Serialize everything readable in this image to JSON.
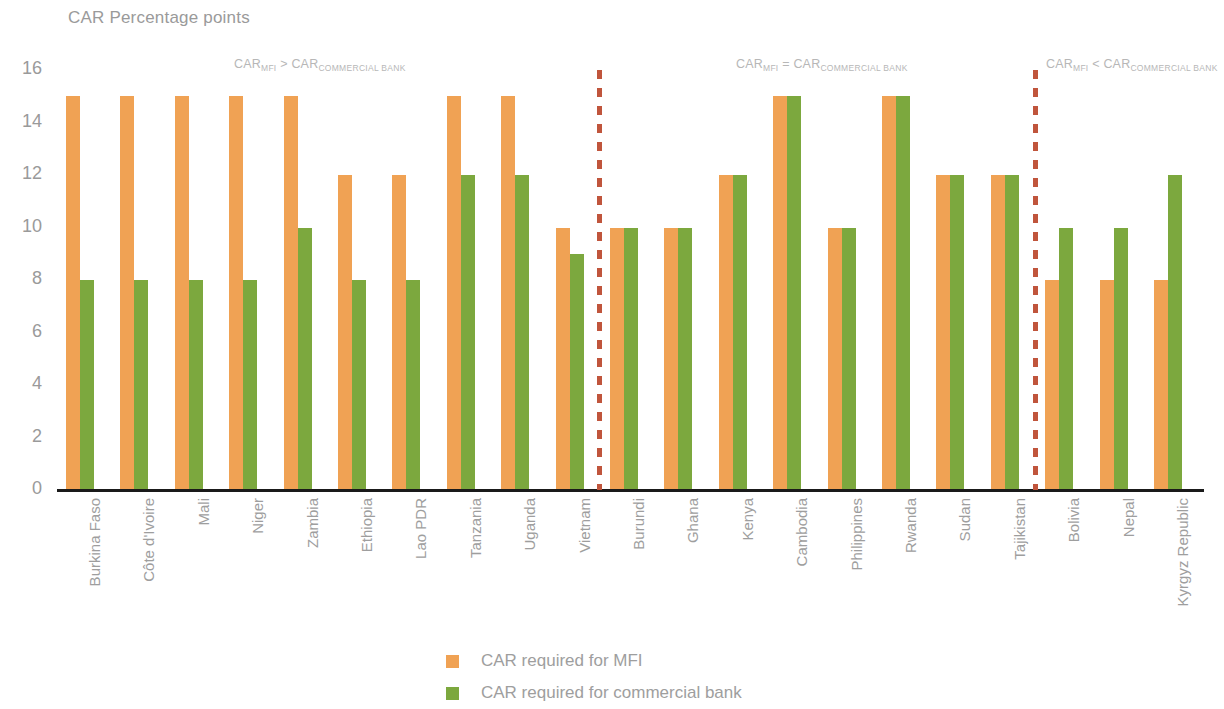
{
  "chart_data": {
    "type": "bar",
    "title": "CAR Percentage points",
    "xlabel": "",
    "ylabel": "",
    "ylim": [
      0,
      16
    ],
    "yticks": [
      16,
      14,
      12,
      10,
      8,
      6,
      4,
      2,
      0
    ],
    "grid": false,
    "legend_position": "bottom",
    "categories": [
      "Burkina Faso",
      "Côte d'Ivoire",
      "Mali",
      "Niger",
      "Zambia",
      "Ethiopia",
      "Lao PDR",
      "Tanzania",
      "Uganda",
      "Vietnam",
      "Burundi",
      "Ghana",
      "Kenya",
      "Cambodia",
      "Philippines",
      "Rwanda",
      "Sudan",
      "Tajikistan",
      "Bolivia",
      "Nepal",
      "Kyrgyz Republic"
    ],
    "series": [
      {
        "name": "CAR required for MFI",
        "color": "#f0a254",
        "values": [
          15,
          15,
          15,
          15,
          15,
          12,
          12,
          15,
          15,
          10,
          10,
          10,
          12,
          15,
          10,
          15,
          12,
          12,
          8,
          8,
          8
        ]
      },
      {
        "name": "CAR required for commercial bank",
        "color": "#7ca83e",
        "values": [
          8,
          8,
          8,
          8,
          10,
          8,
          8,
          12,
          12,
          9,
          10,
          10,
          12,
          15,
          10,
          15,
          12,
          12,
          10,
          10,
          12
        ]
      }
    ],
    "annotations": [
      {
        "main": "CAR",
        "sub1": "MFI",
        "op": " > CAR",
        "sub2": "COMMERCIAL BANK",
        "x": 234
      },
      {
        "main": "CAR",
        "sub1": "MFI",
        "op": " = CAR",
        "sub2": "COMMERCIAL BANK",
        "x": 736
      },
      {
        "main": "CAR",
        "sub1": "MFI",
        "op": " < CAR",
        "sub2": "COMMERCIAL BANK",
        "x": 1046
      }
    ],
    "dividers": [
      {
        "after_category": "Vietnam",
        "x": 597,
        "color": "#c0553c"
      },
      {
        "after_category": "Tajikistan",
        "x": 1033,
        "color": "#c0553c"
      }
    ]
  },
  "legend": {
    "items": [
      {
        "label": "CAR required for MFI",
        "color": "#f0a254"
      },
      {
        "label": "CAR required for commercial bank",
        "color": "#7ca83e"
      }
    ]
  }
}
